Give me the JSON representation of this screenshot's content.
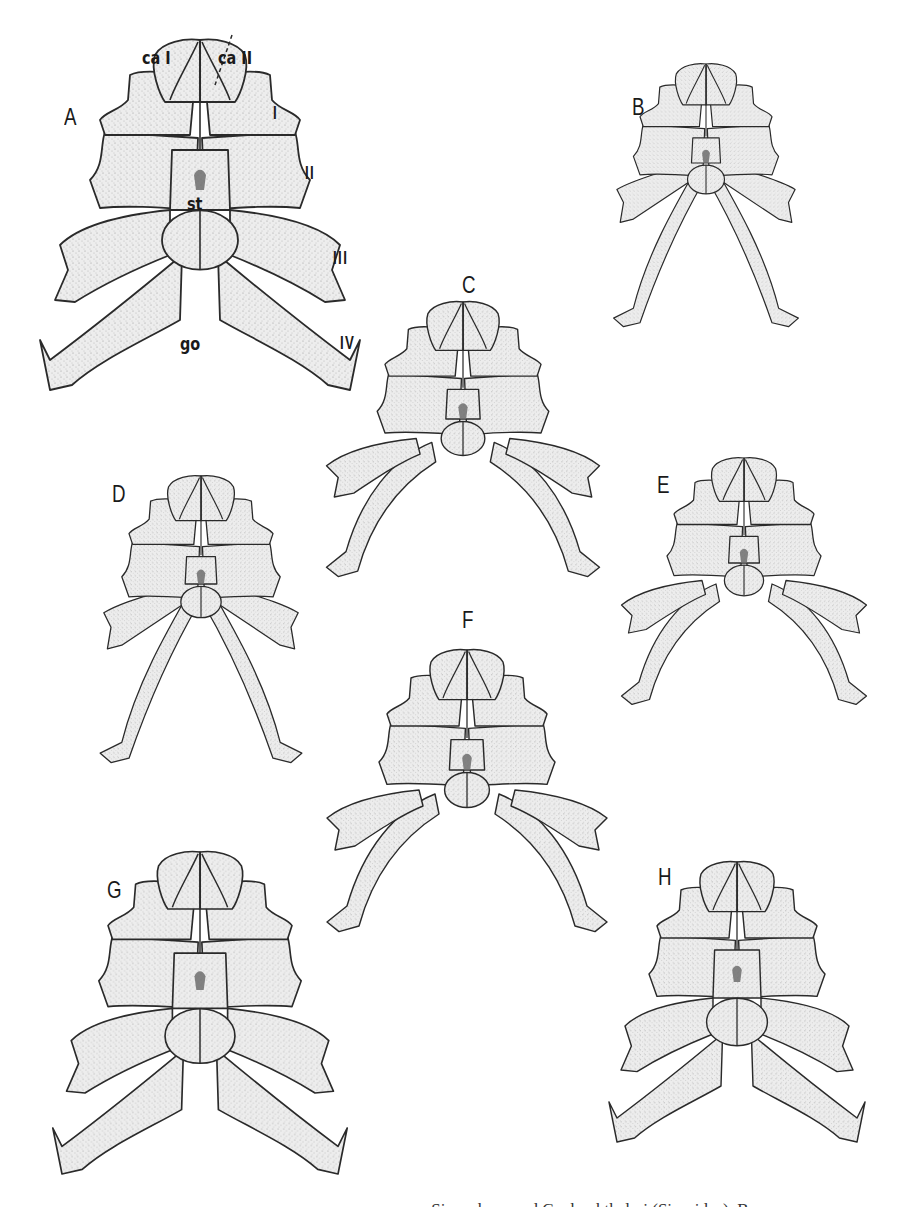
{
  "figure": {
    "panels": [
      {
        "id": "A",
        "label": "A",
        "cx": 200,
        "top": 40,
        "scale": 1.0,
        "variant": "wide",
        "label_x": 64,
        "label_y": 105
      },
      {
        "id": "B",
        "label": "B",
        "cx": 706,
        "top": 64,
        "scale": 0.66,
        "variant": "narrow",
        "label_x": 632,
        "label_y": 95
      },
      {
        "id": "C",
        "label": "C",
        "cx": 463,
        "top": 302,
        "scale": 0.78,
        "variant": "arched",
        "label_x": 462,
        "label_y": 273
      },
      {
        "id": "D",
        "label": "D",
        "cx": 201,
        "top": 476,
        "scale": 0.72,
        "variant": "narrow",
        "label_x": 112,
        "label_y": 482
      },
      {
        "id": "E",
        "label": "E",
        "cx": 744,
        "top": 458,
        "scale": 0.7,
        "variant": "arched",
        "label_x": 657,
        "label_y": 473
      },
      {
        "id": "F",
        "label": "F",
        "cx": 467,
        "top": 650,
        "scale": 0.8,
        "variant": "arched",
        "label_x": 462,
        "label_y": 608
      },
      {
        "id": "G",
        "label": "G",
        "cx": 200,
        "top": 852,
        "scale": 0.92,
        "variant": "wide",
        "label_x": 107,
        "label_y": 878
      },
      {
        "id": "H",
        "label": "H",
        "cx": 737,
        "top": 862,
        "scale": 0.8,
        "variant": "wide",
        "label_x": 658,
        "label_y": 865
      }
    ],
    "annotations": [
      {
        "id": "ca-i",
        "text": "ca I",
        "x": 142,
        "y": 50
      },
      {
        "id": "ca-ii",
        "text": "ca II",
        "x": 218,
        "y": 50
      },
      {
        "id": "st",
        "text": "st",
        "x": 187,
        "y": 196
      },
      {
        "id": "go",
        "text": "go",
        "x": 180,
        "y": 338
      }
    ],
    "leg_numerals": [
      {
        "id": "leg-i",
        "text": "I",
        "x": 273,
        "y": 108
      },
      {
        "id": "leg-ii",
        "text": "II",
        "x": 306,
        "y": 168
      },
      {
        "id": "leg-iii",
        "text": "III",
        "x": 336,
        "y": 252
      },
      {
        "id": "leg-iv",
        "text": "IV",
        "x": 342,
        "y": 337
      }
    ],
    "caption_fragment": "… Siro rubens and Cyphophthalmi (Sironidae), B…",
    "colors": {
      "ink": "#2a2a2a",
      "paper": "#ffffff",
      "stipple": "#e4e4e4"
    }
  }
}
